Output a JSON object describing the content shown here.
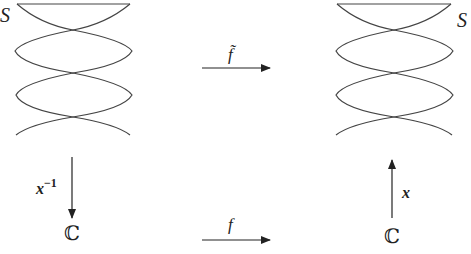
{
  "diagram": {
    "type": "commutative-diagram",
    "nodes": {
      "top_left": {
        "label": "S",
        "shape": "helix-surface"
      },
      "top_right": {
        "label": "S",
        "shape": "helix-surface"
      },
      "bottom_left": {
        "label": "ℂ"
      },
      "bottom_right": {
        "label": "ℂ"
      }
    },
    "arrows": {
      "top": {
        "label": "f̃",
        "from": "top_left",
        "to": "top_right"
      },
      "bottom": {
        "label": "f",
        "from": "bottom_left",
        "to": "bottom_right"
      },
      "left": {
        "label_base": "x",
        "label_sup": "−1",
        "from": "top_left",
        "to": "bottom_left"
      },
      "right": {
        "label": "x",
        "from": "bottom_right",
        "to": "top_right"
      }
    },
    "colors": {
      "stroke": "#333333",
      "background": "#ffffff"
    }
  }
}
